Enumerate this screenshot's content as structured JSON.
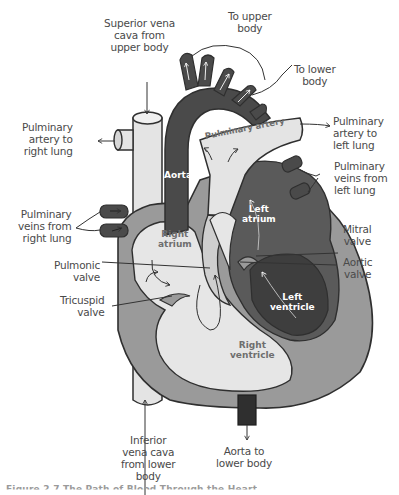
{
  "diagram": {
    "type": "heart anatomy blood flow",
    "colors": {
      "deoxygenated": "#e4e4e4",
      "oxygenated": "#4a4a4a",
      "muscle": "#9a9a9a",
      "outline": "#2f2f2f",
      "label_text": "#4a4a4a",
      "inner_text_light": "#ffffff",
      "inner_text_dark": "#6e6e6e"
    },
    "outer_labels": {
      "superior_vena_cava": [
        "Superior vena",
        "cava from",
        "upper body"
      ],
      "to_upper_body": [
        "To upper",
        "body"
      ],
      "to_lower_body": [
        "To lower",
        "body"
      ],
      "pulm_artery_right": [
        "Pulminary",
        "artery to",
        "right lung"
      ],
      "pulm_artery_left": [
        "Pulminary",
        "artery to",
        "left lung"
      ],
      "pulm_veins_left": [
        "Pulminary",
        "veins from",
        "left lung"
      ],
      "pulm_veins_right": [
        "Pulminary",
        "veins from",
        "right lung"
      ],
      "mitral_valve": [
        "Mitral",
        "valve"
      ],
      "aortic_valve": [
        "Aortic",
        "valve"
      ],
      "pulmonic_valve": [
        "Pulmonic",
        "valve"
      ],
      "tricuspid_valve": [
        "Tricuspid",
        "valve"
      ],
      "inferior_vena_cava": [
        "Inferior",
        "vena cava",
        "from lower",
        "body"
      ],
      "aorta_lower": [
        "Aorta to",
        "lower body"
      ]
    },
    "inner_labels": {
      "aorta": "Aorta",
      "pulminary_artery": "Pulminary artery",
      "left_atrium": [
        "Left",
        "atrium"
      ],
      "right_atrium": [
        "Right",
        "atrium"
      ],
      "left_ventricle": [
        "Left",
        "ventricle"
      ],
      "right_ventricle": [
        "Right",
        "ventricle"
      ]
    },
    "caption": "Figure 2.7 The Path of Blood Through the Heart"
  }
}
